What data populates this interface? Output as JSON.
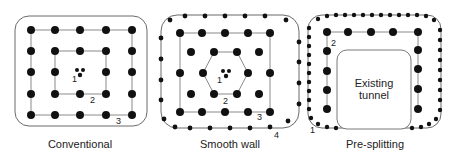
{
  "figure": {
    "panels": [
      {
        "id": "conventional",
        "caption": "Conventional",
        "labels": [
          "1",
          "2",
          "3"
        ]
      },
      {
        "id": "smooth-wall",
        "caption": "Smooth wall",
        "labels": [
          "1",
          "2",
          "3",
          "4"
        ]
      },
      {
        "id": "pre-splitting",
        "caption": "Pre-splitting",
        "labels": [
          "1",
          "2"
        ],
        "tunnel_label_line1": "Existing",
        "tunnel_label_line2": "tunnel"
      }
    ],
    "colors": {
      "ink": "#1a1a1a",
      "line": "#8a8a8a",
      "background": "#ffffff"
    }
  }
}
